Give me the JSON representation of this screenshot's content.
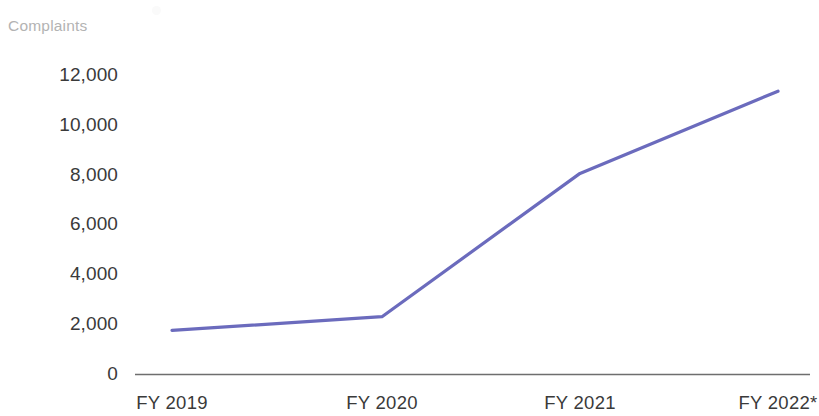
{
  "chart_data": {
    "type": "line",
    "title": "",
    "subtitle": "",
    "ylabel": "Complaints",
    "xlabel": "",
    "categories": [
      "FY 2019",
      "FY 2020",
      "FY 2021",
      "FY 2022*"
    ],
    "series": [
      {
        "name": "Complaints",
        "values": [
          1750,
          2300,
          8050,
          11350
        ],
        "color": "#6b6bbd"
      }
    ],
    "ylim": [
      0,
      12000
    ],
    "yticks": [
      0,
      2000,
      4000,
      6000,
      8000,
      10000,
      12000
    ],
    "ytick_labels": [
      "0",
      "2,000",
      "4,000",
      "6,000",
      "8,000",
      "10,000",
      "12,000"
    ],
    "grid": false,
    "legend": "none",
    "axis_line_color": "#6e6e6e",
    "tick_label_color": "#3a3a3a",
    "axis_title_color": "#b3b3b3",
    "note": "FY 2022*"
  },
  "axis": {
    "y_title": "Complaints"
  },
  "ytick_labels": [
    {
      "label": "12,000",
      "value": 12000
    },
    {
      "label": "10,000",
      "value": 10000
    },
    {
      "label": "8,000",
      "value": 8000
    },
    {
      "label": "6,000",
      "value": 6000
    },
    {
      "label": "4,000",
      "value": 4000
    },
    {
      "label": "2,000",
      "value": 2000
    },
    {
      "label": "0",
      "value": 0
    }
  ],
  "xtick_labels": [
    {
      "label": "FY 2019"
    },
    {
      "label": "FY 2020"
    },
    {
      "label": "FY 2021"
    },
    {
      "label": "FY 2022*"
    }
  ]
}
